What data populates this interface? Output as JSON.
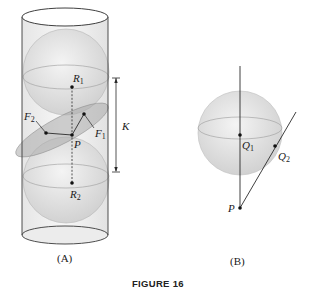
{
  "figure": {
    "caption": "FIGURE 16",
    "panels": [
      {
        "id": "A",
        "label": "(A)",
        "points": {
          "R1": {
            "main": "R",
            "sub": "1"
          },
          "R2": {
            "main": "R",
            "sub": "2"
          },
          "P": {
            "main": "P"
          },
          "F1": {
            "main": "F",
            "sub": "1"
          },
          "F2": {
            "main": "F",
            "sub": "2"
          }
        },
        "dimension_label": "K"
      },
      {
        "id": "B",
        "label": "(B)",
        "points": {
          "Q1": {
            "main": "Q",
            "sub": "1"
          },
          "Q2": {
            "main": "Q",
            "sub": "2"
          },
          "P": {
            "main": "P"
          }
        }
      }
    ]
  },
  "colors": {
    "line": "#2a2a2a",
    "sphere_fill": "#dcdcdc",
    "ellipse_fill": "#b8b8b8",
    "cylinder_fill": "#f0f0f0"
  }
}
